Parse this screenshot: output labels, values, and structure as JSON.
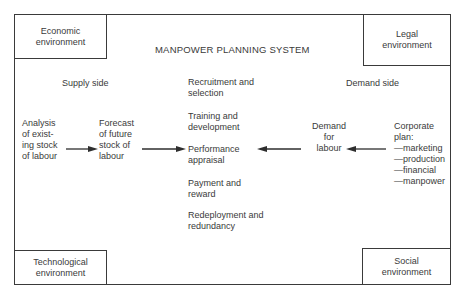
{
  "diagram": {
    "title": "MANPOWER PLANNING SYSTEM",
    "environments": {
      "economic": "Economic\nenvironment",
      "legal": "Legal\nenvironment",
      "technological": "Technological\nenvironment",
      "social": "Social\nenvironment"
    },
    "sides": {
      "supply": "Supply side",
      "demand": "Demand side"
    },
    "supply_nodes": {
      "analysis": "Analysis\nof exist-\ning stock\nof labour",
      "forecast": "Forecast\nof future\nstock of\nlabour"
    },
    "demand_nodes": {
      "demand_for_labour": "Demand\nfor\nlabour",
      "corporate_plan": "Corporate\nplan:\n—marketing\n—production\n—financial\n—manpower"
    },
    "activities": [
      "Recruitment and\nselection",
      "Training and\ndevelopment",
      "Performance\nappraisal",
      "Payment and\nreward",
      "Redeployment and\nredundancy"
    ],
    "arrows": [
      {
        "from": "Analysis of existing stock of labour",
        "to": "Forecast of future stock of labour",
        "direction": "right"
      },
      {
        "from": "Forecast of future stock of labour",
        "to": "Performance appraisal",
        "direction": "right"
      },
      {
        "from": "Demand for labour",
        "to": "Performance appraisal",
        "direction": "left"
      },
      {
        "from": "Corporate plan",
        "to": "Demand for labour",
        "direction": "left"
      }
    ],
    "colors": {
      "line": "#3a3a3a",
      "text": "#3a3a3a",
      "background": "#ffffff"
    }
  }
}
